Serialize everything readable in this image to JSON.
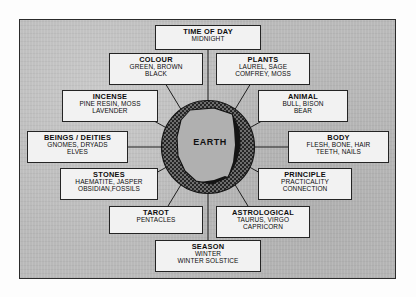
{
  "diagram": {
    "center": {
      "label": "EARTH",
      "shape_name": "earth-element-circle"
    },
    "panel": {
      "background_color": "#b9b9b9",
      "border_color": "#2b2b2b"
    },
    "box_style": {
      "background_color": "#f2f2f2",
      "border_color": "#242424"
    },
    "boxes": [
      {
        "key": "time-of-day",
        "title": "TIME OF DAY",
        "lines": [
          "MIDNIGHT"
        ]
      },
      {
        "key": "colour",
        "title": "COLOUR",
        "lines": [
          "GREEN, BROWN",
          "BLACK"
        ]
      },
      {
        "key": "plants",
        "title": "PLANTS",
        "lines": [
          "LAUREL, SAGE",
          "COMFREY, MOSS"
        ]
      },
      {
        "key": "incense",
        "title": "INCENSE",
        "lines": [
          "PINE RESIN, MOSS",
          "LAVENDER"
        ]
      },
      {
        "key": "animal",
        "title": "ANIMAL",
        "lines": [
          "BULL, BISON",
          "BEAR"
        ]
      },
      {
        "key": "beings-deities",
        "title": "BEINGS / DEITIES",
        "lines": [
          "GNOMES, DRYADS",
          "ELVES"
        ]
      },
      {
        "key": "body",
        "title": "BODY",
        "lines": [
          "FLESH, BONE, HAIR",
          "TEETH, NAILS"
        ]
      },
      {
        "key": "stones",
        "title": "STONES",
        "lines": [
          "HAEMATITE, JASPER",
          "OBSIDIAN,FOSSILS"
        ]
      },
      {
        "key": "principle",
        "title": "PRINCIPLE",
        "lines": [
          "PRACTICALITY",
          "CONNECTION"
        ]
      },
      {
        "key": "tarot",
        "title": "TAROT",
        "lines": [
          "PENTACLES"
        ]
      },
      {
        "key": "astrological",
        "title": "ASTROLOGICAL",
        "lines": [
          "TAURUS, VIRGO",
          "CAPRICORN"
        ]
      },
      {
        "key": "season",
        "title": "SEASON",
        "lines": [
          "WINTER",
          "WINTER SOLSTICE"
        ]
      }
    ]
  }
}
